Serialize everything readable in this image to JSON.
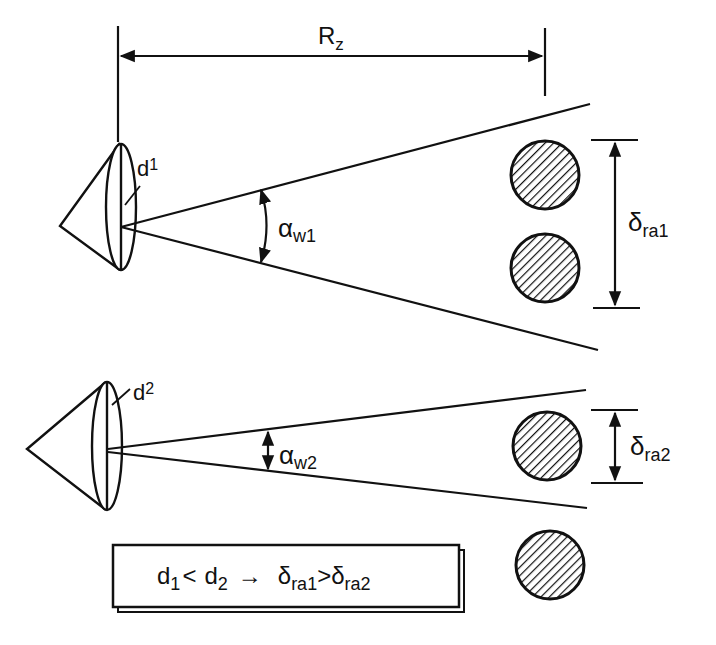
{
  "diagram": {
    "range_label": {
      "main": "R",
      "sub": "z"
    },
    "top_antenna": {
      "aperture_label": {
        "main": "d",
        "sub": "1"
      },
      "beamwidth_label": {
        "main": "α",
        "sub": "w1"
      },
      "resolution_label": {
        "main": "δ",
        "sub": "ra1"
      }
    },
    "bottom_antenna": {
      "aperture_label": {
        "main": "d",
        "sub": "2"
      },
      "beamwidth_label": {
        "main": "α",
        "sub": "w2"
      },
      "resolution_label": {
        "main": "δ",
        "sub": "ra2"
      }
    },
    "conclusion": {
      "d1": "d",
      "d1_sub": "1",
      "lt": "<",
      "d2": "d",
      "d2_sub": "2",
      "arrow": "→",
      "r1": "δ",
      "r1_sub": "ra1",
      "gt": ">",
      "r2": "δ",
      "r2_sub": "ra2"
    },
    "targets_count": 4,
    "colors": {
      "ink": "#111111",
      "background": "#ffffff"
    }
  }
}
